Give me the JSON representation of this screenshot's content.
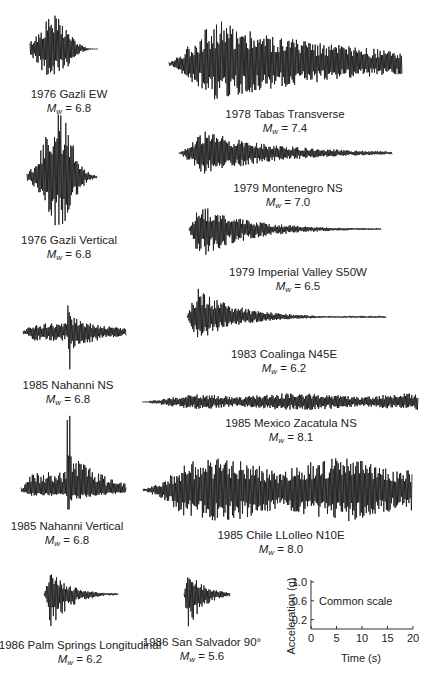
{
  "chart_data": {
    "type": "line",
    "records": [
      {
        "event": "1976 Gazli EW",
        "mw": "6.8",
        "center_x": 69,
        "baseline_y": 49,
        "x_start": 30,
        "x_end": 98,
        "peak_up": 34,
        "peak_down": 32,
        "shape": "burst",
        "onset": 0.35,
        "decay": 0.5
      },
      {
        "event": "1978 Tabas Transverse",
        "mw": "7.4",
        "center_x": 285,
        "baseline_y": 64,
        "x_start": 169,
        "x_end": 402,
        "peak_up": 45,
        "peak_down": 37,
        "shape": "long",
        "onset": 0.2,
        "decay": 1.6
      },
      {
        "event": "1976 Gazli Vertical",
        "mw": "6.8",
        "center_x": 69,
        "baseline_y": 177,
        "x_start": 27,
        "x_end": 97,
        "peak_up": 63,
        "peak_down": 50,
        "shape": "burst",
        "onset": 0.45,
        "decay": 0.5
      },
      {
        "event": "1979 Montenegro NS",
        "mw": "7.0",
        "center_x": 288,
        "baseline_y": 153,
        "x_start": 179,
        "x_end": 392,
        "peak_up": 22,
        "peak_down": 22,
        "shape": "decay",
        "onset": 0.12,
        "decay": 3.0
      },
      {
        "event": "1979 Imperial Valley S50W",
        "mw": "6.5",
        "center_x": 298,
        "baseline_y": 229,
        "x_start": 189,
        "x_end": 381,
        "peak_up": 25,
        "peak_down": 30,
        "shape": "decay",
        "onset": 0.05,
        "decay": 4.0
      },
      {
        "event": "1985 Nahanni NS",
        "mw": "6.8",
        "center_x": 68,
        "baseline_y": 332,
        "x_start": 23,
        "x_end": 126,
        "peak_up": 38,
        "peak_down": 40,
        "shape": "spike",
        "onset": 0.45,
        "decay": 3.0
      },
      {
        "event": "1983 Coalinga N45E",
        "mw": "6.2",
        "center_x": 284,
        "baseline_y": 317,
        "x_start": 187,
        "x_end": 386,
        "peak_up": 30,
        "peak_down": 24,
        "shape": "decay",
        "onset": 0.05,
        "decay": 5.0
      },
      {
        "event": "1985 Mexico Zacatula NS",
        "mw": "8.1",
        "center_x": 291,
        "baseline_y": 402,
        "x_start": 142,
        "x_end": 418,
        "peak_up": 9,
        "peak_down": 8,
        "shape": "long",
        "onset": 0.2,
        "decay": 0.0
      },
      {
        "event": "1985 Nahanni Vertical",
        "mw": "6.8",
        "center_x": 67,
        "baseline_y": 491,
        "x_start": 21,
        "x_end": 126,
        "peak_up": 88,
        "peak_down": 22,
        "shape": "spike",
        "onset": 0.45,
        "decay": 3.0
      },
      {
        "event": "1985 Chile LLolleo N10E",
        "mw": "8.0",
        "center_x": 281,
        "baseline_y": 490,
        "x_start": 143,
        "x_end": 412,
        "peak_up": 32,
        "peak_down": 32,
        "shape": "long",
        "onset": 0.15,
        "decay": 0.0
      },
      {
        "event": "1986 Palm Springs Longitudinal",
        "mw": "6.2",
        "center_x": 80,
        "baseline_y": 594,
        "x_start": 44,
        "x_end": 118,
        "peak_up": 24,
        "peak_down": 38,
        "shape": "decay",
        "onset": 0.1,
        "decay": 4.0
      },
      {
        "event": "1986 San Salvador 90°",
        "mw": "5.6",
        "center_x": 202,
        "baseline_y": 594,
        "x_start": 184,
        "x_end": 230,
        "peak_up": 24,
        "peak_down": 35,
        "shape": "decay",
        "onset": 0.1,
        "decay": 3.0
      }
    ],
    "scale_axes": {
      "title": "Common scale",
      "xlabel": "Time (s)",
      "ylabel": "Acceleration (g)",
      "x_ticks": [
        "0",
        "5",
        "10",
        "15",
        "20"
      ],
      "y_ticks": [
        "0.2",
        "0.6",
        "1.0"
      ],
      "xlim": [
        0,
        20
      ],
      "ylim": [
        0,
        1.0
      ],
      "grid": false
    }
  },
  "labels": {
    "magnitude_symbol": "M",
    "magnitude_subscript": "w",
    "equals": " = "
  }
}
